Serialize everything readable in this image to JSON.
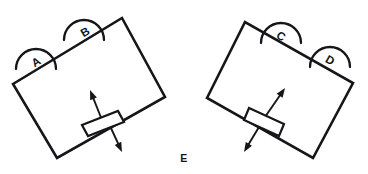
{
  "figure": {
    "type": "line-diagram",
    "width": 368,
    "height": 174,
    "background_color": "#ffffff",
    "ink_color": "#15161a",
    "caption": {
      "label": "E",
      "x": 184,
      "y": 158
    },
    "panels": [
      {
        "id": "left-panel",
        "name": "left-plate-assembly",
        "plate": {
          "name": "left-plate",
          "corners": [
            [
              13,
              84
            ],
            [
              122,
              18
            ],
            [
              165,
              97
            ],
            [
              57,
              158
            ]
          ]
        },
        "slider": {
          "name": "left-slider-bar",
          "corners": [
            [
              82,
              125
            ],
            [
              118,
              111
            ],
            [
              124,
              122
            ],
            [
              88,
              136
            ]
          ]
        },
        "arrows": [
          {
            "name": "left-arrow-up",
            "direction": "up-left",
            "from": [
              102,
              120
            ],
            "to": [
              90,
              90
            ]
          },
          {
            "name": "left-arrow-down",
            "direction": "down-right",
            "from": [
              110,
              126
            ],
            "to": [
              122,
              152
            ]
          }
        ],
        "arcs": [
          {
            "label": "A",
            "name": "rotation-arc-a",
            "center": [
              36,
              63
            ],
            "radius": 20,
            "label_pos": [
              36,
              62
            ],
            "label_rotation": -31
          },
          {
            "label": "B",
            "name": "rotation-arc-b",
            "center": [
              84,
              34
            ],
            "radius": 20,
            "label_pos": [
              85,
              32
            ],
            "label_rotation": -31
          }
        ]
      },
      {
        "id": "right-panel",
        "name": "right-plate-assembly",
        "plate": {
          "name": "right-plate",
          "corners": [
            [
              207,
              98
            ],
            [
              245,
              22
            ],
            [
              353,
              83
            ],
            [
              313,
              158
            ]
          ]
        },
        "slider": {
          "name": "right-slider-bar",
          "corners": [
            [
              249,
              108
            ],
            [
              284,
              124
            ],
            [
              279,
              136
            ],
            [
              244,
              120
            ]
          ]
        },
        "arrows": [
          {
            "name": "right-arrow-up",
            "direction": "up-right",
            "from": [
              265,
              117
            ],
            "to": [
              285,
              88
            ]
          },
          {
            "name": "right-arrow-down",
            "direction": "down-left",
            "from": [
              259,
              127
            ],
            "to": [
              244,
              152
            ]
          }
        ],
        "arcs": [
          {
            "label": "C",
            "name": "rotation-arc-c",
            "center": [
              281,
              37
            ],
            "radius": 20,
            "label_pos": [
              281,
              36
            ],
            "label_rotation": 30
          },
          {
            "label": "D",
            "name": "rotation-arc-d",
            "center": [
              330,
              61
            ],
            "radius": 20,
            "label_pos": [
              330,
              60
            ],
            "label_rotation": 30
          }
        ]
      }
    ]
  }
}
